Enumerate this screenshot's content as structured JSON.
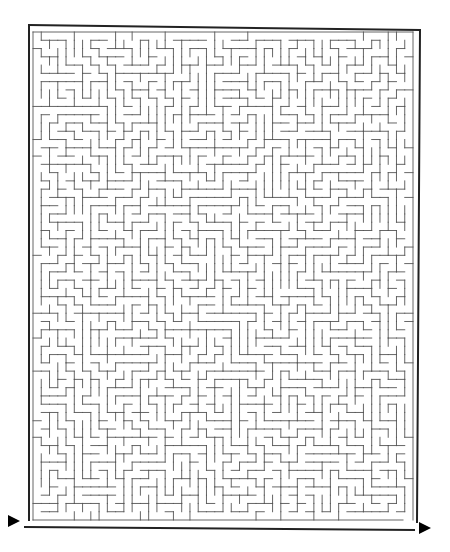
{
  "puzzle": {
    "type": "maze",
    "entrance_label": "start-arrow",
    "exit_label": "end-arrow"
  },
  "colors": {
    "background": "#ffffff",
    "frame": "#222222",
    "walls": "#555555",
    "arrows": "#000000"
  },
  "frame": {
    "outer": {
      "x1": 29,
      "y1": 25,
      "x2": 420,
      "y2": 30
    },
    "left_x": 29,
    "right_x": 417,
    "top_y": 25,
    "bottom_y": 528
  },
  "grid": {
    "x0": 33,
    "y0": 32,
    "cols": 46,
    "rows": 59,
    "cell": 8.3,
    "seed": 7
  },
  "arrows": {
    "entrance": {
      "x": 8,
      "y": 521,
      "direction": "right"
    },
    "exit": {
      "x": 419,
      "y": 528,
      "direction": "right"
    }
  }
}
